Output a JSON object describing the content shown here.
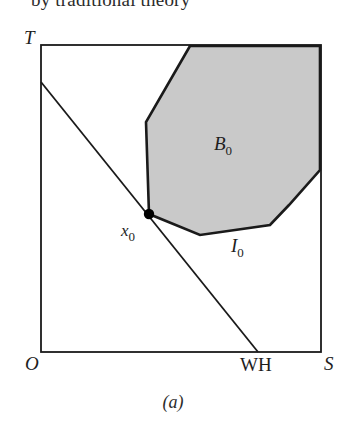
{
  "page": {
    "width": 346,
    "height": 435,
    "background_color": "#ffffff"
  },
  "cropped_text_above": "by traditional theory",
  "figure": {
    "caption": "(a)",
    "axes": {
      "origin_label": "O",
      "y_axis_top_label": "T",
      "x_axis_right_label": "S",
      "x_axis_tick_label": "WH"
    },
    "labels": {
      "budget_region": "B",
      "budget_region_subscript": "0",
      "indifference_curve": "I",
      "indifference_curve_subscript": "0",
      "point": "x",
      "point_subscript": "0"
    },
    "colors": {
      "line": "#1a1a1a",
      "shaded_region_fill": "#c9c9c9",
      "shaded_region_stroke": "#1a1a1a",
      "point_marker": "#000000",
      "frame": "#1a1a1a"
    },
    "geometry": {
      "frame": {
        "x": 41,
        "y": 45,
        "width": 280,
        "height": 307
      },
      "budget_line": {
        "x1": 41,
        "y1": 82,
        "x2": 258,
        "y2": 352
      },
      "point_x0": {
        "cx": 149,
        "cy": 214,
        "r": 5
      },
      "shaded_polygon": "190,46 146,122 149,214 200,235 270,225 289,205 320,170 320,46"
    }
  }
}
